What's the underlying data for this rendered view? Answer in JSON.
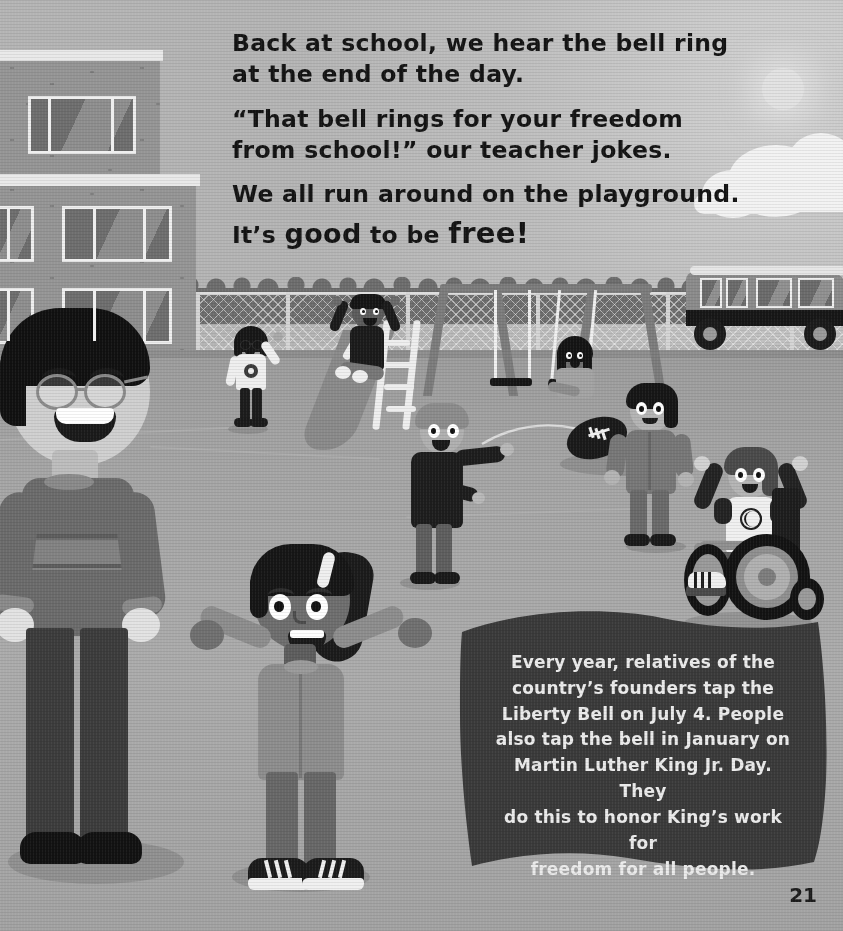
{
  "page": {
    "number": "21",
    "type": "illustrated-children-book-page",
    "palette": {
      "sky": "#bdbdbd",
      "ground": "#a5a5a5",
      "building": "#959595",
      "flag_background": "#3a3a3a",
      "flag_text": "#ebebeb",
      "story_text": "#141414"
    }
  },
  "story": {
    "paragraphs": [
      "Back at school, we hear the bell ring at the end of the day.",
      "“That bell rings for your freedom from school!” our teacher jokes.",
      "We all run around on the playground."
    ],
    "closing": {
      "lead": "It’s ",
      "emphasis_one": "good",
      "middle": " to be ",
      "emphasis_two": "free!"
    }
  },
  "fact_box": {
    "label": "fact-flag",
    "text": "Every year, relatives of the country’s founders tap the Liberty Bell on July 4. People also tap the bell in January on Martin Luther King Jr. Day. They do this to honor King’s work for freedom for all people.",
    "lines": [
      "Every year, relatives of the",
      "country’s founders tap the",
      "Liberty Bell on July 4. People",
      "also tap the bell in January on",
      "Martin Luther King Jr. Day. They",
      "do this to honor King’s work for",
      "freedom for all people."
    ]
  },
  "scene": {
    "setting": "school playground",
    "sky": {
      "sun": "sun-icon",
      "clouds": 2
    },
    "background": {
      "school_building": "brick school with large windows",
      "treeline": "row of trees",
      "fence": "chain-link fence",
      "bus": "school bus"
    },
    "equipment": [
      {
        "name": "slide",
        "rider": "child sliding with arms raised"
      },
      {
        "name": "swing-set",
        "rider": "child swinging"
      }
    ],
    "characters": [
      {
        "id": "teacher",
        "description": "adult teacher with glasses and striped sweater, arms open"
      },
      {
        "id": "girl-glasses",
        "description": "girl with glasses and bob haircut waving, flower shirt"
      },
      {
        "id": "boy-slide",
        "description": "boy sliding down the slide, arms up"
      },
      {
        "id": "girl-swing",
        "description": "girl on the swing"
      },
      {
        "id": "boy-thrower",
        "description": "boy in dark sweater throwing a football"
      },
      {
        "id": "boy-catcher",
        "description": "boy in gray jacket reaching for the football"
      },
      {
        "id": "boy-wheelchair",
        "description": "boy in a wheelchair wearing a baseball shirt, arms raised"
      },
      {
        "id": "girl-foreground",
        "description": "girl with ponytail in hoodie, arms spread wide"
      }
    ],
    "objects": [
      {
        "name": "football",
        "description": "football in mid-air"
      }
    ]
  }
}
